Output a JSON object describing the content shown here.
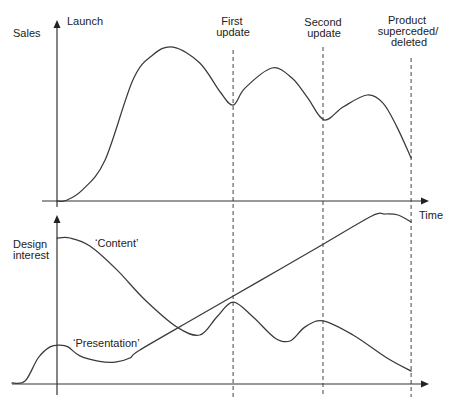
{
  "figure": {
    "top_chart": {
      "ylabel": "Sales"
    },
    "bottom_chart": {
      "ylabel_lines": [
        "Design",
        "interest"
      ]
    },
    "xlabel": "Time",
    "events": {
      "launch": {
        "lines": [
          "Launch"
        ],
        "x": 0
      },
      "first_update": {
        "lines": [
          "First",
          "update"
        ],
        "x": 47.6
      },
      "second_update": {
        "lines": [
          "Second",
          "update"
        ],
        "x": 71.9
      },
      "product_end": {
        "lines": [
          "Product",
          "superceded/",
          "deleted"
        ],
        "x": 95.7
      }
    },
    "series_labels": {
      "content": "‘Content’",
      "presentation": "‘Presentation’"
    }
  },
  "colors": {
    "background": "#ffffff",
    "line": "#3a3a3a",
    "axis": "#333333",
    "text": "#222222"
  },
  "chart_data": [
    {
      "type": "line",
      "title": "",
      "xlabel": "Time",
      "ylabel": "Sales",
      "xlim": [
        0,
        100
      ],
      "ylim": [
        0,
        100
      ],
      "grid": false,
      "legend": null,
      "annotations": [
        {
          "x": 0,
          "text": "Launch"
        },
        {
          "x": 47.6,
          "text": "First update"
        },
        {
          "x": 71.9,
          "text": "Second update"
        },
        {
          "x": 95.7,
          "text": "Product superceded/deleted"
        }
      ],
      "series": [
        {
          "name": "Sales",
          "points": [
            [
              0,
              0
            ],
            [
              2.4,
              0.3
            ],
            [
              6.8,
              6.1
            ],
            [
              13.0,
              22.9
            ],
            [
              20.5,
              67.6
            ],
            [
              25.9,
              81.6
            ],
            [
              31.4,
              86.0
            ],
            [
              38.6,
              77.1
            ],
            [
              44.1,
              60.9
            ],
            [
              47.6,
              53.6
            ],
            [
              50.8,
              63.1
            ],
            [
              58.1,
              74.3
            ],
            [
              63.5,
              68.7
            ],
            [
              67.8,
              57.5
            ],
            [
              72.2,
              45.3
            ],
            [
              77.3,
              52.5
            ],
            [
              83.8,
              59.2
            ],
            [
              88.1,
              54.7
            ],
            [
              91.9,
              41.3
            ],
            [
              95.7,
              24.0
            ]
          ]
        }
      ]
    },
    {
      "type": "line",
      "title": "",
      "xlabel": "Time",
      "ylabel": "Design interest",
      "xlim": [
        -12.2,
        100
      ],
      "ylim": [
        0,
        100
      ],
      "grid": false,
      "legend": null,
      "annotations": [
        {
          "x": 47.6,
          "text": "First update"
        },
        {
          "x": 71.9,
          "text": "Second update"
        },
        {
          "x": 95.7,
          "text": "Product superceded/deleted"
        }
      ],
      "series": [
        {
          "name": "‘Content’",
          "points": [
            [
              0,
              85.9
            ],
            [
              3.5,
              85.9
            ],
            [
              8.9,
              81.2
            ],
            [
              16.2,
              67.1
            ],
            [
              23.8,
              49.4
            ],
            [
              32.4,
              33.5
            ],
            [
              38.6,
              28.8
            ],
            [
              43.2,
              39.4
            ],
            [
              47.6,
              48.2
            ],
            [
              53.0,
              39.4
            ],
            [
              58.9,
              27.1
            ],
            [
              63.0,
              25.3
            ],
            [
              67.0,
              33.5
            ],
            [
              71.9,
              37.1
            ],
            [
              80.0,
              28.8
            ],
            [
              89.2,
              15.3
            ],
            [
              95.7,
              7.6
            ]
          ]
        },
        {
          "name": "‘Presentation’",
          "points": [
            [
              -12.2,
              0.6
            ],
            [
              -8.6,
              1.8
            ],
            [
              -5.1,
              15.3
            ],
            [
              -1.9,
              21.8
            ],
            [
              0.8,
              22.9
            ],
            [
              3.0,
              21.8
            ],
            [
              6.2,
              16.5
            ],
            [
              11.1,
              13.5
            ],
            [
              15.7,
              12.9
            ],
            [
              19.7,
              15.3
            ],
            [
              22.4,
              20.0
            ],
            [
              38.6,
              40.4
            ],
            [
              54.9,
              60.8
            ],
            [
              71.1,
              81.2
            ],
            [
              85.1,
              98.8
            ],
            [
              88.6,
              100.0
            ],
            [
              92.2,
              99.4
            ],
            [
              95.7,
              95.3
            ]
          ]
        }
      ]
    }
  ]
}
